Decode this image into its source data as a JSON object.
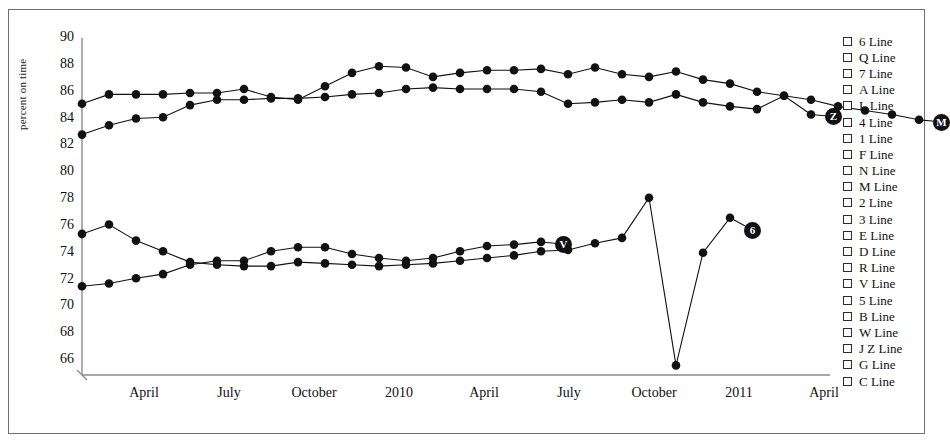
{
  "chart_data": {
    "type": "line",
    "title": "",
    "xlabel": "",
    "ylabel": "percent on time",
    "ylim": [
      66,
      90
    ],
    "ytick_values": [
      90,
      88,
      86,
      84,
      82,
      80,
      78,
      76,
      74,
      72,
      70,
      68,
      66
    ],
    "xtick_labels": [
      "April",
      "July",
      "October",
      "2010",
      "April",
      "July",
      "October",
      "2011",
      "April"
    ],
    "grid": false,
    "legend_position": "right",
    "marker": "filled-circle",
    "line_color": "#111111",
    "series": [
      {
        "name": "Z",
        "end_label": "Z",
        "x_index": [
          0,
          1,
          2,
          3,
          4,
          5,
          6,
          7,
          8,
          9,
          10,
          11,
          12,
          13,
          14,
          15,
          16,
          17,
          18,
          19,
          20,
          21,
          22,
          23,
          24,
          25,
          26,
          27
        ],
        "values": [
          85.1,
          85.8,
          85.8,
          85.8,
          85.9,
          85.9,
          86.2,
          85.6,
          85.4,
          86.4,
          87.4,
          87.9,
          87.8,
          87.1,
          87.4,
          87.6,
          87.6,
          87.7,
          87.3,
          87.8,
          87.3,
          87.1,
          87.5,
          86.9,
          86.6,
          86.0,
          85.7,
          84.3
        ]
      },
      {
        "name": "M",
        "end_label": "M",
        "x_index": [
          0,
          1,
          2,
          3,
          4,
          5,
          6,
          7,
          8,
          9,
          10,
          11,
          12,
          13,
          14,
          15,
          16,
          17,
          18,
          19,
          20,
          21,
          22,
          23,
          24,
          25,
          26,
          27,
          28,
          29,
          30,
          31
        ],
        "values": [
          82.8,
          83.5,
          84.0,
          84.1,
          85.0,
          85.4,
          85.4,
          85.5,
          85.5,
          85.6,
          85.8,
          85.9,
          86.2,
          86.3,
          86.2,
          86.2,
          86.2,
          86.0,
          85.1,
          85.2,
          85.4,
          85.2,
          85.8,
          85.2,
          84.9,
          84.7,
          85.7,
          85.4,
          84.9,
          84.6,
          84.3,
          83.9
        ]
      },
      {
        "name": "6",
        "end_label": "6",
        "x_index": [
          0,
          1,
          2,
          3,
          4,
          5,
          6,
          7,
          8,
          9,
          10,
          11,
          12,
          13,
          14,
          15,
          16,
          17,
          18,
          19,
          20,
          21,
          22,
          23,
          24,
          25,
          26,
          27,
          28
        ],
        "values": [
          75.4,
          76.1,
          74.9,
          74.1,
          73.3,
          73.1,
          73.0,
          73.0,
          73.3,
          73.2,
          73.1,
          73.0,
          73.1,
          73.2,
          73.4,
          73.6,
          73.8,
          74.1,
          74.2,
          74.7,
          75.1,
          78.1,
          65.6,
          74.0,
          76.6
        ]
      },
      {
        "name": "V",
        "end_label": "V",
        "x_index": [
          0,
          1,
          2,
          3,
          4,
          5,
          6,
          7,
          8,
          9,
          10,
          11,
          12,
          13,
          14,
          15,
          16,
          17
        ],
        "values": [
          71.5,
          71.7,
          72.1,
          72.4,
          73.1,
          73.4,
          73.4,
          74.1,
          74.4,
          74.4,
          73.9,
          73.6,
          73.4,
          73.6,
          74.1,
          74.5,
          74.6,
          74.8
        ]
      }
    ]
  },
  "legend": {
    "items": [
      {
        "label": "6 Line",
        "checked": false
      },
      {
        "label": "Q Line",
        "checked": false
      },
      {
        "label": "7 Line",
        "checked": false
      },
      {
        "label": "A Line",
        "checked": false
      },
      {
        "label": "L Line",
        "checked": false
      },
      {
        "label": "4 Line",
        "checked": false
      },
      {
        "label": "1 Line",
        "checked": false
      },
      {
        "label": "F Line",
        "checked": false
      },
      {
        "label": "N Line",
        "checked": false
      },
      {
        "label": "M Line",
        "checked": false
      },
      {
        "label": "2 Line",
        "checked": false
      },
      {
        "label": "3 Line",
        "checked": false
      },
      {
        "label": "E Line",
        "checked": false
      },
      {
        "label": "D Line",
        "checked": false
      },
      {
        "label": "R Line",
        "checked": false
      },
      {
        "label": "V Line",
        "checked": false
      },
      {
        "label": "5 Line",
        "checked": false
      },
      {
        "label": "B Line",
        "checked": false
      },
      {
        "label": "W Line",
        "checked": false
      },
      {
        "label": "J Z Line",
        "checked": false
      },
      {
        "label": "G Line",
        "checked": false
      },
      {
        "label": "C Line",
        "checked": false
      }
    ]
  }
}
